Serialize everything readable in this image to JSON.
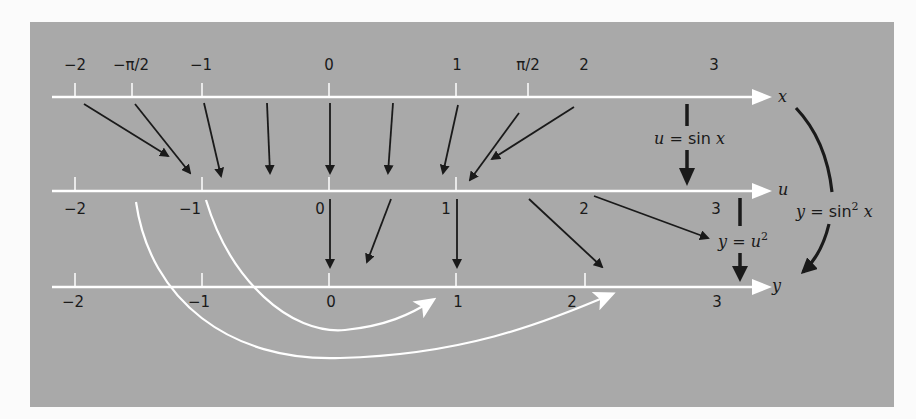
{
  "diagram": {
    "colors": {
      "page_background": "#fbfbfb",
      "panel_background": "#a9a9a9",
      "axis_color": "#ffffff",
      "arrow_color": "#1a1a1a",
      "curve_arrow_color": "#ffffff"
    },
    "axes": [
      {
        "name": "x",
        "label": "x",
        "label_position": "above",
        "ticks": [
          {
            "value": -2,
            "label": "−2",
            "tick": true
          },
          {
            "value": -1.5708,
            "label": "−π/2",
            "tick": true
          },
          {
            "value": -1,
            "label": "−1",
            "tick": true
          },
          {
            "value": 0,
            "label": "0",
            "tick": true
          },
          {
            "value": 1,
            "label": "1",
            "tick": true
          },
          {
            "value": 1.5708,
            "label": "π/2",
            "tick": true
          },
          {
            "value": 2,
            "label": "2",
            "tick": false
          },
          {
            "value": 3,
            "label": "3",
            "tick": false
          }
        ]
      },
      {
        "name": "u",
        "label": "u",
        "label_position": "below",
        "ticks": [
          {
            "value": -2,
            "label": "−2",
            "tick": true
          },
          {
            "value": -1,
            "label": "−1",
            "tick": true
          },
          {
            "value": 0,
            "label": "0",
            "tick": true
          },
          {
            "value": 1,
            "label": "1",
            "tick": true
          },
          {
            "value": 2,
            "label": "2",
            "tick": false
          },
          {
            "value": 3,
            "label": "3",
            "tick": false
          }
        ]
      },
      {
        "name": "y",
        "label": "y",
        "label_position": "below",
        "ticks": [
          {
            "value": -2,
            "label": "−2",
            "tick": true
          },
          {
            "value": -1,
            "label": "−1",
            "tick": true
          },
          {
            "value": 0,
            "label": "0",
            "tick": true
          },
          {
            "value": 1,
            "label": "1",
            "tick": true
          },
          {
            "value": 2,
            "label": "2",
            "tick": true
          },
          {
            "value": 3,
            "label": "3",
            "tick": false
          }
        ]
      }
    ],
    "function_labels": {
      "u_eq_sin_x": {
        "lhs": "u",
        "eq": " = ",
        "fn": "sin ",
        "var": "x"
      },
      "y_eq_u_sq": {
        "lhs": "y",
        "eq": " = ",
        "base": "u",
        "exp": "2"
      },
      "y_eq_sin_sq_x": {
        "lhs": "y",
        "eq": " = ",
        "fn": "sin",
        "exp": "2",
        "var": " x"
      }
    },
    "mappings": {
      "x_to_u": [
        {
          "from": -2,
          "to": -0.91
        },
        {
          "from": -1.5708,
          "to": -1
        },
        {
          "from": -1,
          "to": -0.84
        },
        {
          "from": -0.5,
          "to": -0.48
        },
        {
          "from": 0,
          "to": 0
        },
        {
          "from": 0.5,
          "to": 0.48
        },
        {
          "from": 1,
          "to": 0.84
        },
        {
          "from": 1.5708,
          "to": 1
        },
        {
          "from": 2,
          "to": 0.91
        }
      ],
      "u_to_y": [
        {
          "from": 0,
          "to": 0
        },
        {
          "from": 0.5,
          "to": 0.25
        },
        {
          "from": 1,
          "to": 1
        },
        {
          "from": 1.5,
          "to": 2.25
        },
        {
          "from": 2,
          "to": 4
        },
        {
          "from": -1,
          "to": 1
        },
        {
          "from": -1.5708,
          "to": 2.47
        }
      ]
    }
  }
}
